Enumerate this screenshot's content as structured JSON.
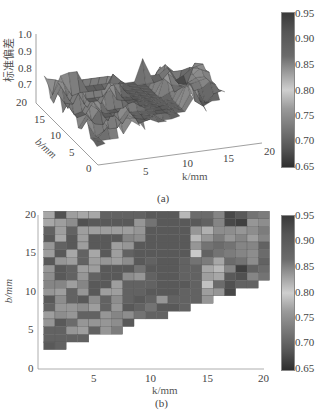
{
  "chart_data": [
    {
      "type": "surface3d",
      "panel_label": "(a)",
      "title": "",
      "zlabel": "标准偏差",
      "xlabel": "k/mm",
      "ylabel": "b/mm",
      "xticks": [
        "5",
        "10",
        "15",
        "20"
      ],
      "yticks": [
        "0",
        "5",
        "10",
        "15",
        "20"
      ],
      "zticks": [
        "0.7",
        "0.8",
        "0.9",
        "1.0"
      ],
      "zlim": [
        0.65,
        1.0
      ],
      "colorbar": {
        "min": 0.65,
        "max": 0.95,
        "ticks": [
          "0.95",
          "0.90",
          "0.85",
          "0.80",
          "0.75",
          "0.70",
          "0.65"
        ]
      },
      "note": "Surface of standard deviation over k (1-20 mm) and b (2-20 mm, b ≥ ~k/2+1); values ~0.68-0.95"
    },
    {
      "type": "heatmap",
      "panel_label": "(b)",
      "title": "",
      "xlabel": "k/mm",
      "ylabel": "b/mm",
      "xticks": [
        "5",
        "10",
        "15",
        "20"
      ],
      "yticks": [
        "0",
        "5",
        "10",
        "15",
        "20"
      ],
      "xlim": [
        0,
        20
      ],
      "ylim": [
        0,
        20
      ],
      "colorbar": {
        "min": 0.65,
        "max": 0.95,
        "ticks": [
          "0.95",
          "0.90",
          "0.85",
          "0.80",
          "0.75",
          "0.70",
          "0.65"
        ]
      },
      "x": [
        1,
        2,
        3,
        4,
        5,
        6,
        7,
        8,
        9,
        10,
        11,
        12,
        13,
        14,
        15,
        16,
        17,
        18,
        19,
        20
      ],
      "y_rows_top_to_bottom": [
        20,
        19,
        18,
        17,
        16,
        15,
        14,
        13,
        12,
        11,
        10,
        9,
        8,
        7,
        6,
        5,
        4,
        3,
        2
      ],
      "min_b_per_column": [
        2,
        2,
        3,
        3,
        4,
        4,
        5,
        6,
        7,
        7,
        8,
        8,
        9,
        10,
        10,
        11,
        11,
        12,
        12,
        12
      ],
      "values": [
        [
          0.78,
          0.68,
          0.77,
          0.78,
          0.78,
          0.7,
          0.7,
          0.7,
          0.7,
          0.69,
          0.69,
          0.69,
          0.8,
          0.71,
          0.71,
          0.74,
          0.67,
          0.69,
          0.72,
          0.73
        ],
        [
          0.78,
          0.77,
          0.75,
          0.68,
          0.69,
          0.69,
          0.69,
          0.69,
          0.76,
          0.72,
          0.69,
          0.69,
          0.69,
          0.69,
          0.7,
          0.74,
          0.67,
          0.66,
          0.76,
          0.75
        ],
        [
          0.7,
          0.77,
          0.7,
          0.77,
          0.77,
          0.77,
          0.77,
          0.77,
          0.76,
          0.69,
          0.69,
          0.69,
          0.69,
          0.76,
          0.79,
          0.75,
          0.75,
          0.76,
          0.75,
          0.73
        ],
        [
          0.69,
          0.78,
          0.69,
          0.77,
          0.69,
          0.69,
          0.69,
          0.74,
          0.75,
          0.69,
          0.69,
          0.69,
          0.69,
          0.8,
          0.76,
          0.73,
          0.76,
          0.74,
          0.77,
          0.74
        ],
        [
          0.76,
          0.7,
          0.69,
          0.77,
          0.69,
          0.69,
          0.77,
          0.76,
          0.69,
          0.69,
          0.69,
          0.69,
          0.69,
          0.76,
          0.72,
          0.71,
          0.72,
          0.74,
          0.74,
          0.7
        ],
        [
          0.77,
          0.69,
          0.78,
          0.7,
          0.78,
          0.69,
          0.77,
          0.7,
          0.69,
          0.69,
          0.69,
          0.69,
          0.69,
          0.82,
          0.7,
          0.72,
          0.73,
          0.74,
          0.75,
          0.71
        ],
        [
          0.69,
          0.76,
          0.77,
          0.7,
          0.77,
          0.76,
          0.77,
          0.75,
          0.69,
          0.7,
          0.69,
          0.69,
          0.7,
          0.72,
          0.73,
          0.78,
          0.71,
          0.72,
          0.75,
          0.7
        ],
        [
          0.76,
          0.69,
          0.7,
          0.77,
          0.77,
          0.69,
          0.69,
          0.69,
          0.72,
          0.69,
          0.69,
          0.69,
          0.7,
          0.7,
          0.78,
          0.8,
          0.74,
          0.66,
          0.7,
          0.71
        ],
        [
          0.75,
          0.69,
          0.7,
          0.76,
          0.7,
          0.69,
          0.69,
          0.75,
          0.76,
          0.7,
          0.69,
          0.69,
          0.7,
          0.7,
          0.77,
          0.78,
          0.69,
          0.68,
          0.74,
          0.72
        ],
        [
          0.74,
          0.74,
          0.77,
          0.74,
          0.69,
          0.69,
          0.77,
          0.7,
          0.7,
          0.7,
          0.69,
          0.69,
          0.69,
          0.7,
          0.81,
          0.71,
          0.68,
          0.7,
          0.7,
          null
        ],
        [
          0.76,
          0.77,
          0.7,
          0.76,
          0.69,
          0.77,
          0.77,
          0.7,
          0.7,
          0.69,
          0.69,
          0.69,
          0.7,
          0.7,
          0.77,
          0.76,
          0.67,
          null,
          null,
          null
        ],
        [
          0.69,
          0.75,
          0.7,
          0.69,
          0.75,
          0.7,
          0.75,
          0.7,
          0.69,
          0.7,
          0.76,
          0.7,
          0.7,
          0.7,
          0.76,
          null,
          null,
          null,
          null,
          null
        ],
        [
          0.7,
          0.76,
          0.76,
          0.75,
          0.77,
          0.7,
          0.76,
          0.69,
          0.7,
          0.72,
          0.69,
          0.69,
          0.7,
          null,
          null,
          null,
          null,
          null,
          null,
          null
        ],
        [
          0.77,
          0.75,
          0.76,
          0.7,
          0.7,
          0.76,
          0.74,
          0.75,
          0.72,
          0.7,
          0.7,
          null,
          null,
          null,
          null,
          null,
          null,
          null,
          null,
          null
        ],
        [
          0.76,
          0.69,
          0.71,
          0.76,
          0.76,
          0.76,
          0.75,
          0.69,
          null,
          null,
          null,
          null,
          null,
          null,
          null,
          null,
          null,
          null,
          null,
          null
        ],
        [
          0.7,
          0.7,
          0.76,
          0.77,
          0.7,
          0.76,
          0.73,
          null,
          null,
          null,
          null,
          null,
          null,
          null,
          null,
          null,
          null,
          null,
          null,
          null
        ],
        [
          0.7,
          0.7,
          0.7,
          0.7,
          null,
          null,
          null,
          null,
          null,
          null,
          null,
          null,
          null,
          null,
          null,
          null,
          null,
          null,
          null,
          null
        ],
        [
          0.69,
          0.7,
          null,
          null,
          null,
          null,
          null,
          null,
          null,
          null,
          null,
          null,
          null,
          null,
          null,
          null,
          null,
          null,
          null,
          null
        ],
        [
          null,
          null,
          null,
          null,
          null,
          null,
          null,
          null,
          null,
          null,
          null,
          null,
          null,
          null,
          null,
          null,
          null,
          null,
          null,
          null
        ]
      ]
    }
  ],
  "panel_a": {
    "label": "(a)",
    "zlabel": "标准偏差",
    "xlabel": "k/mm",
    "ylabel": "b/mm",
    "zticks": [
      "1.0",
      "0.9",
      "0.8",
      "0.7"
    ],
    "bticks": [
      "20",
      "15",
      "10",
      "5",
      "0"
    ],
    "kticks": [
      "5",
      "10",
      "15",
      "20"
    ],
    "cbticks": [
      "0.95",
      "0.90",
      "0.85",
      "0.80",
      "0.75",
      "0.70",
      "0.65"
    ]
  },
  "panel_b": {
    "label": "(b)",
    "xlabel": "k/mm",
    "ylabel": "b/mm",
    "yticks": [
      "20",
      "15",
      "10",
      "5",
      "0"
    ],
    "xticks": [
      "5",
      "10",
      "15",
      "20"
    ],
    "cbticks": [
      "0.95",
      "0.90",
      "0.85",
      "0.80",
      "0.75",
      "0.70",
      "0.65"
    ]
  }
}
